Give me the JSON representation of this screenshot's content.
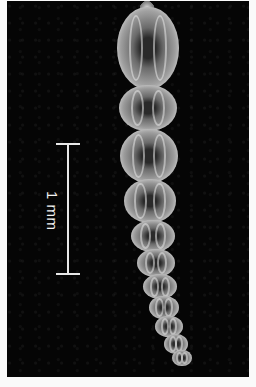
{
  "image": {
    "subject": "elongated chambered microfossil specimen on black background",
    "background_color": "#050505",
    "border_color": "#fafafa"
  },
  "scale_bar": {
    "label": "1 mm",
    "orientation": "vertical",
    "color": "#e8e8e8"
  }
}
